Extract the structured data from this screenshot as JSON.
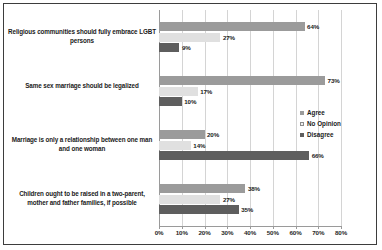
{
  "chart_data": {
    "type": "bar",
    "orientation": "horizontal",
    "title": "",
    "xlabel": "",
    "ylabel": "",
    "xlim": [
      0,
      80
    ],
    "xticks": [
      "0%",
      "10%",
      "20%",
      "30%",
      "40%",
      "50%",
      "60%",
      "70%",
      "80%"
    ],
    "grid": true,
    "legend_position": "right",
    "categories": [
      "Religious communities should fully embrace LGBT persons",
      "Same sex marriage should be legalized",
      "Marriage is only a relationship between one man and one woman",
      "Children ought to be raised in a two-parent, mother and father families, if possible"
    ],
    "series": [
      {
        "name": "Agree",
        "color": "#9b9b9b",
        "values": [
          64,
          73,
          20,
          38
        ],
        "labels": [
          "64%",
          "73%",
          "20%",
          "38%"
        ]
      },
      {
        "name": "No Opinion",
        "color": "#e0e0e0",
        "values": [
          27,
          17,
          14,
          27
        ],
        "labels": [
          "27%",
          "17%",
          "14%",
          "27%"
        ]
      },
      {
        "name": "Disagree",
        "color": "#5e5e5e",
        "values": [
          9,
          10,
          66,
          35
        ],
        "labels": [
          "9%",
          "10%",
          "66%",
          "35%"
        ]
      }
    ]
  },
  "legend": {
    "items": [
      {
        "label": "Agree"
      },
      {
        "label": "No Opinion"
      },
      {
        "label": "Disagree"
      }
    ]
  },
  "axis": {
    "ticks": [
      {
        "label": "0%"
      },
      {
        "label": "10%"
      },
      {
        "label": "20%"
      },
      {
        "label": "30%"
      },
      {
        "label": "40%"
      },
      {
        "label": "50%"
      },
      {
        "label": "60%"
      },
      {
        "label": "70%"
      },
      {
        "label": "80%"
      }
    ]
  },
  "category_labels": [
    {
      "text": "Religious communities should fully embrace LGBT persons"
    },
    {
      "text": "Same sex marriage should be legalized"
    },
    {
      "text": "Marriage is only a relationship between one man and one woman"
    },
    {
      "text": "Children ought to be raised in a two-parent, mother and father families, if possible"
    }
  ]
}
